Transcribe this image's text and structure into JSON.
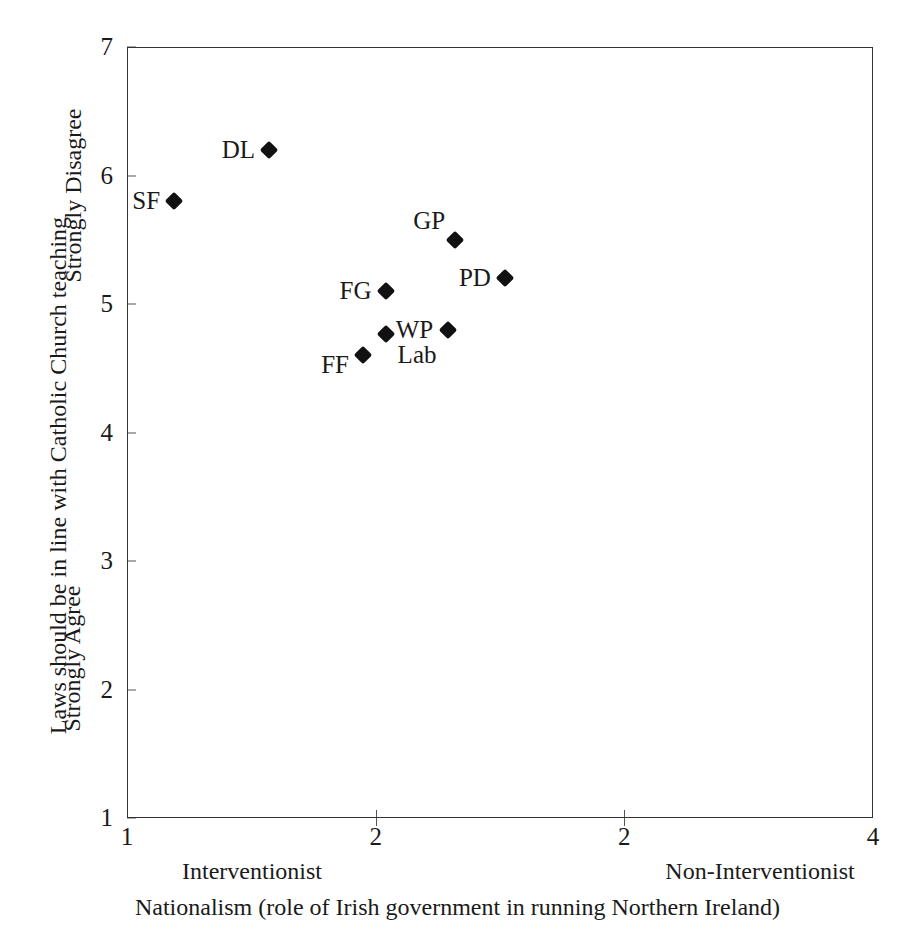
{
  "chart_data": {
    "type": "scatter",
    "title": "",
    "xlabel": "Nationalism (role of Irish government in running Northern Ireland)",
    "ylabel": "Laws should be in line with Catholic Church teaching",
    "xlim": [
      1,
      4
    ],
    "ylim": [
      1,
      7
    ],
    "grid": false,
    "legend": "none",
    "x_tick_labels": [
      "1",
      "2",
      "2",
      "4"
    ],
    "x_tick_positions": [
      1,
      2,
      3,
      4
    ],
    "y_tick_labels": [
      "1",
      "2",
      "3",
      "4",
      "5",
      "6",
      "7"
    ],
    "y_tick_values": [
      1,
      2,
      3,
      4,
      5,
      6,
      7
    ],
    "x_anchor_low": "Interventionist",
    "x_anchor_high": "Non-Interventionist",
    "y_anchor_high": "Strongly Disagree",
    "y_anchor_low": "Strongly Agree",
    "marker_shape": "diamond",
    "marker_color": "#111111",
    "points": [
      {
        "label": "DL",
        "x": 1.57,
        "y": 6.2,
        "label_side": "left"
      },
      {
        "label": "SF",
        "x": 1.19,
        "y": 5.8,
        "label_side": "left"
      },
      {
        "label": "GP",
        "x": 2.32,
        "y": 5.5,
        "label_side": "upper-left"
      },
      {
        "label": "PD",
        "x": 2.52,
        "y": 5.2,
        "label_side": "left"
      },
      {
        "label": "FG",
        "x": 2.04,
        "y": 5.1,
        "label_side": "left"
      },
      {
        "label": "WP",
        "x": 2.29,
        "y": 4.8,
        "label_side": "left"
      },
      {
        "label": "Lab",
        "x": 2.04,
        "y": 4.77,
        "label_side": "lower-right"
      },
      {
        "label": "FF",
        "x": 1.95,
        "y": 4.6,
        "label_side": "lower-left"
      }
    ]
  }
}
